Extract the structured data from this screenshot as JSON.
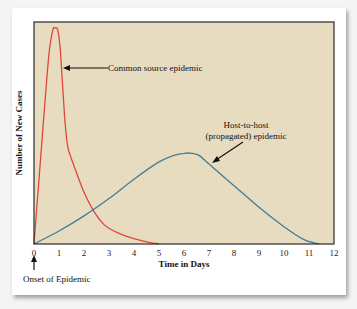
{
  "chart_data": {
    "type": "line",
    "title": "",
    "xlabel": "Time in Days",
    "ylabel": "Number of New Cases",
    "xlim": [
      0,
      12
    ],
    "ylim": [
      0,
      1
    ],
    "x_ticks": [
      "0",
      "1",
      "2",
      "3",
      "4",
      "5",
      "6",
      "7",
      "8",
      "9",
      "10",
      "11",
      "12"
    ],
    "y_ticks": [],
    "grid": false,
    "colors": {
      "background": "#e8dcc0",
      "common": "#e0463a",
      "propagated": "#3f7f95",
      "frame": "#2a2a2a"
    },
    "series": [
      {
        "name": "Common source epidemic",
        "x": [
          0,
          0.2,
          0.4,
          0.6,
          0.75,
          0.85,
          0.95,
          1.05,
          1.15,
          1.25,
          1.35,
          1.45,
          1.7,
          2.0,
          2.4,
          2.8,
          3.2,
          3.6,
          4.0,
          4.5,
          5.0
        ],
        "values": [
          0,
          0.3,
          0.6,
          0.88,
          0.99,
          1.0,
          0.99,
          0.9,
          0.72,
          0.55,
          0.45,
          0.41,
          0.33,
          0.24,
          0.15,
          0.09,
          0.06,
          0.04,
          0.025,
          0.01,
          0
        ]
      },
      {
        "name": "Host-to-host (propagated) epidemic",
        "x": [
          0,
          1,
          2,
          3,
          4,
          5,
          5.6,
          6.0,
          6.3,
          6.6,
          7,
          8,
          9,
          10,
          10.8,
          11.4
        ],
        "values": [
          0,
          0.06,
          0.13,
          0.21,
          0.3,
          0.38,
          0.41,
          0.42,
          0.42,
          0.41,
          0.37,
          0.27,
          0.17,
          0.08,
          0.02,
          0
        ]
      }
    ],
    "annotations": [
      {
        "text": "Common source epidemic",
        "points_to_series": 0
      },
      {
        "text_lines": [
          "Host-to-host",
          "(propagated) epidemic"
        ],
        "points_to_series": 1
      },
      {
        "text": "Onset of Epidemic",
        "points_to_x": 0
      }
    ]
  }
}
